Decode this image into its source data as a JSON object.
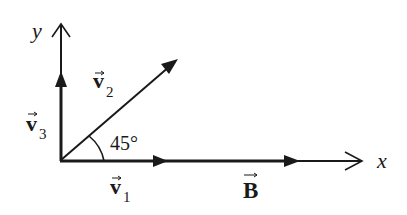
{
  "diagram": {
    "axes": {
      "x_label": "x",
      "y_label": "y"
    },
    "vectors": [
      {
        "id": "v1",
        "symbol": "v",
        "subscript": "1",
        "direction": "along +x"
      },
      {
        "id": "v2",
        "symbol": "v",
        "subscript": "2",
        "direction": "45° from +x"
      },
      {
        "id": "v3",
        "symbol": "v",
        "subscript": "3",
        "direction": "along +y"
      },
      {
        "id": "B",
        "symbol": "B",
        "subscript": "",
        "direction": "along +x"
      }
    ],
    "angle_label": "45°",
    "colors": {
      "ink": "#1a1a1a",
      "background": "#ffffff"
    }
  }
}
